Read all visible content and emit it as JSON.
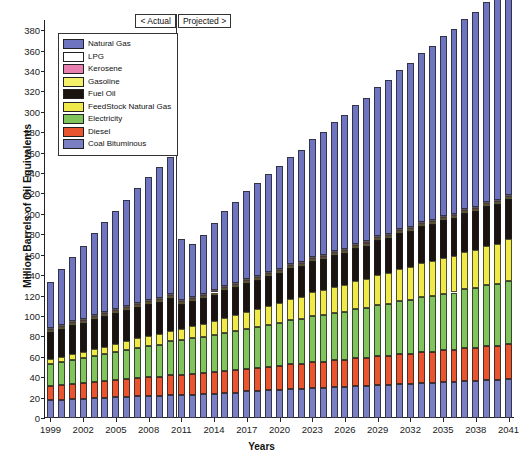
{
  "chart_data": {
    "type": "bar",
    "stacked": true,
    "title": "",
    "xlabel": "Years",
    "ylabel": "Million Barrels of Oil Equivalents",
    "ylim": [
      0,
      390
    ],
    "ytick_step": 20,
    "yticks": [
      0,
      20,
      40,
      60,
      80,
      100,
      120,
      140,
      160,
      180,
      200,
      220,
      240,
      260,
      280,
      300,
      320,
      340,
      360,
      380
    ],
    "grid": false,
    "legend_position": "upper-left",
    "annotations": [
      {
        "text": "< Actual",
        "position": "top-left-of-divider"
      },
      {
        "text": "Projected >",
        "position": "top-right-of-divider"
      }
    ],
    "divider_between": [
      2010,
      2011
    ],
    "categories": [
      1999,
      2000,
      2001,
      2002,
      2003,
      2004,
      2005,
      2006,
      2007,
      2008,
      2009,
      2010,
      2011,
      2012,
      2013,
      2014,
      2015,
      2016,
      2017,
      2018,
      2019,
      2020,
      2021,
      2022,
      2023,
      2024,
      2025,
      2026,
      2027,
      2028,
      2029,
      2030,
      2031,
      2032,
      2033,
      2034,
      2035,
      2036,
      2037,
      2038,
      2039,
      2040,
      2041
    ],
    "xtick_labels": [
      "1999",
      "2002",
      "2005",
      "2008",
      "2011",
      "2014",
      "2017",
      "2020",
      "2023",
      "2026",
      "2029",
      "2032",
      "2035",
      "2038",
      "2041"
    ],
    "xtick_indices": [
      0,
      3,
      6,
      9,
      12,
      15,
      18,
      21,
      24,
      27,
      30,
      33,
      36,
      39,
      42
    ],
    "series": [
      {
        "name": "Coal Bituminous",
        "color": "#7a7fc4",
        "values": [
          18,
          18,
          19,
          19,
          20,
          20,
          21,
          21,
          22,
          22,
          22,
          23,
          23,
          23,
          24,
          24,
          25,
          25,
          26,
          26,
          27,
          27,
          28,
          28,
          29,
          29,
          30,
          30,
          31,
          31,
          32,
          32,
          33,
          33,
          34,
          34,
          35,
          35,
          36,
          36,
          37,
          37,
          38
        ]
      },
      {
        "name": "Diesel",
        "color": "#e8552e",
        "values": [
          13,
          14,
          14,
          15,
          15,
          16,
          16,
          17,
          17,
          18,
          18,
          19,
          19,
          20,
          20,
          21,
          21,
          22,
          22,
          23,
          23,
          24,
          25,
          25,
          26,
          26,
          27,
          27,
          28,
          28,
          29,
          29,
          30,
          30,
          31,
          31,
          32,
          32,
          33,
          33,
          34,
          34,
          35
        ]
      },
      {
        "name": "Electricity",
        "color": "#82c45c",
        "values": [
          22,
          23,
          24,
          25,
          26,
          27,
          28,
          29,
          30,
          31,
          32,
          33,
          34,
          35,
          35,
          36,
          37,
          38,
          39,
          40,
          41,
          42,
          43,
          44,
          45,
          46,
          46,
          47,
          48,
          49,
          50,
          51,
          52,
          53,
          54,
          55,
          55,
          56,
          57,
          58,
          59,
          60,
          61
        ]
      },
      {
        "name": "FeedStock Natural Gas",
        "color": "#efe94a",
        "values": [
          5,
          5,
          6,
          6,
          7,
          7,
          8,
          8,
          9,
          9,
          10,
          10,
          11,
          12,
          13,
          14,
          15,
          16,
          17,
          18,
          19,
          20,
          21,
          22,
          23,
          24,
          25,
          26,
          27,
          28,
          29,
          30,
          31,
          32,
          33,
          34,
          35,
          36,
          37,
          38,
          39,
          40,
          41
        ]
      },
      {
        "name": "Fuel Oil",
        "color": "#1a1310",
        "values": [
          26,
          27,
          28,
          28,
          29,
          30,
          30,
          31,
          31,
          32,
          32,
          33,
          25,
          25,
          26,
          26,
          27,
          27,
          28,
          28,
          29,
          29,
          30,
          30,
          31,
          31,
          32,
          32,
          33,
          33,
          34,
          34,
          35,
          35,
          36,
          36,
          37,
          37,
          38,
          38,
          39,
          39,
          40
        ]
      },
      {
        "name": "Gasoline",
        "color": "#f5f06a",
        "values": [
          2,
          2,
          2,
          2,
          2,
          2,
          2,
          2,
          2,
          2,
          2,
          2,
          2,
          2,
          2,
          2,
          2,
          2,
          2,
          2,
          2,
          2,
          2,
          2,
          2,
          2,
          2,
          2,
          2,
          2,
          2,
          2,
          2,
          2,
          2,
          2,
          2,
          2,
          2,
          2,
          2,
          2,
          2
        ]
      },
      {
        "name": "Kerosene",
        "color": "#e87fb0",
        "values": [
          1,
          1,
          1,
          1,
          1,
          1,
          1,
          1,
          1,
          1,
          1,
          1,
          1,
          1,
          1,
          1,
          1,
          1,
          1,
          1,
          1,
          1,
          1,
          1,
          1,
          1,
          1,
          1,
          1,
          1,
          1,
          1,
          1,
          1,
          1,
          1,
          1,
          1,
          1,
          1,
          1,
          1,
          1
        ]
      },
      {
        "name": "LPG",
        "color": "#ffffff",
        "values": [
          1,
          1,
          1,
          1,
          1,
          1,
          1,
          1,
          1,
          1,
          1,
          1,
          1,
          1,
          1,
          1,
          1,
          1,
          1,
          1,
          1,
          1,
          1,
          1,
          1,
          1,
          1,
          1,
          1,
          1,
          1,
          1,
          1,
          1,
          1,
          1,
          1,
          1,
          1,
          1,
          1,
          1,
          1
        ]
      },
      {
        "name": "Natural Gas",
        "color": "#6f74c0",
        "values": [
          45,
          55,
          63,
          72,
          80,
          88,
          96,
          104,
          112,
          120,
          128,
          134,
          59,
          52,
          57,
          66,
          74,
          80,
          86,
          91,
          96,
          101,
          105,
          110,
          115,
          120,
          126,
          131,
          136,
          141,
          146,
          151,
          156,
          161,
          166,
          171,
          176,
          181,
          186,
          191,
          196,
          201,
          206
        ]
      }
    ],
    "legend_order": [
      "Natural Gas",
      "LPG",
      "Kerosene",
      "Gasoline",
      "Fuel Oil",
      "FeedStock Natural Gas",
      "Electricity",
      "Diesel",
      "Coal Bituminous"
    ],
    "stack_order_bottom_to_top": [
      "Coal Bituminous",
      "Diesel",
      "Electricity",
      "FeedStock Natural Gas",
      "Fuel Oil",
      "Gasoline",
      "Kerosene",
      "LPG",
      "Natural Gas"
    ]
  }
}
